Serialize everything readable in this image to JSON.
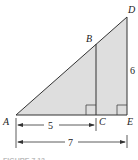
{
  "figure": {
    "points": {
      "A": "A",
      "B": "B",
      "C": "C",
      "D": "D",
      "E": "E"
    },
    "dimensions": {
      "AC": "5",
      "AE": "7",
      "DE": "6"
    },
    "caption": "FIGURE 7.13",
    "colors": {
      "fill": "#dedede",
      "stroke": "#333333"
    }
  }
}
